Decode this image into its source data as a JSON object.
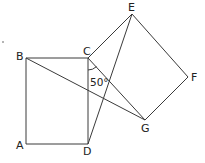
{
  "diagram": {
    "title": "",
    "points": {
      "A": {
        "x": 26,
        "y": 144
      },
      "B": {
        "x": 26,
        "y": 58
      },
      "C": {
        "x": 88,
        "y": 58
      },
      "D": {
        "x": 88,
        "y": 144
      },
      "E": {
        "x": 132,
        "y": 14
      },
      "F": {
        "x": 188,
        "y": 77
      },
      "G": {
        "x": 145,
        "y": 120
      }
    },
    "labels": {
      "A": "A",
      "B": "B",
      "C": "C",
      "D": "D",
      "E": "E",
      "F": "F",
      "G": "G"
    },
    "angle_label": "50°",
    "shapes": {
      "square_ABCD": [
        "A",
        "B",
        "C",
        "D"
      ],
      "square_CEFG": [
        "C",
        "E",
        "F",
        "G"
      ]
    },
    "segments": [
      [
        "B",
        "G"
      ],
      [
        "D",
        "E"
      ]
    ],
    "angle_marker": {
      "vertex": "C",
      "between": [
        "D",
        "G"
      ],
      "value": "50°"
    },
    "stray_mark": {
      "x": 3,
      "y": 42
    },
    "colors": {
      "stroke": "#3a3a3a",
      "text": "#222222",
      "background": "#ffffff"
    }
  }
}
